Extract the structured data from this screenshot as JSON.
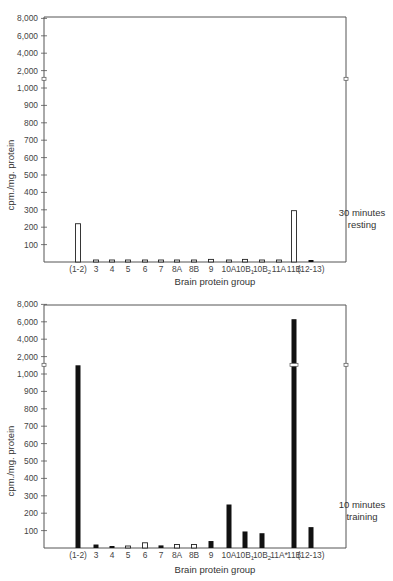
{
  "chart_data": [
    {
      "type": "bar",
      "title": "",
      "annotation": [
        "30 minutes",
        "resting"
      ],
      "xlabel": "Brain protein group",
      "ylabel": "cpm./mg. protein",
      "y_scale": "broken (linear 0–1,000 by 100, then 2,000–8,000 by 2,000)",
      "y_ticks": [
        "100",
        "200",
        "300",
        "400",
        "500",
        "600",
        "700",
        "800",
        "900",
        "1,000",
        "2,000",
        "4,000",
        "6,000",
        "8,000"
      ],
      "ylim": [
        0,
        8000
      ],
      "grid": false,
      "legend": "none",
      "categories": [
        "(1-2)",
        "3",
        "4",
        "5",
        "6",
        "7",
        "8A",
        "8B",
        "9",
        "10A",
        "10B1",
        "10B2",
        "11A",
        "11B",
        "(12-13)"
      ],
      "category_labels": [
        {
          "main": "(1-2)",
          "sub": ""
        },
        {
          "main": "3",
          "sub": ""
        },
        {
          "main": "4",
          "sub": ""
        },
        {
          "main": "5",
          "sub": ""
        },
        {
          "main": "6",
          "sub": ""
        },
        {
          "main": "7",
          "sub": ""
        },
        {
          "main": "8A",
          "sub": ""
        },
        {
          "main": "8B",
          "sub": ""
        },
        {
          "main": "9",
          "sub": ""
        },
        {
          "main": "10A",
          "sub": ""
        },
        {
          "main": "10B",
          "sub": "1"
        },
        {
          "main": "10B",
          "sub": "2"
        },
        {
          "main": "11A",
          "sub": ""
        },
        {
          "main": "11B",
          "sub": ""
        },
        {
          "main": "(12-13)",
          "sub": ""
        }
      ],
      "values": [
        220,
        5,
        5,
        5,
        5,
        5,
        5,
        5,
        15,
        5,
        15,
        5,
        5,
        295,
        5
      ],
      "fill": [
        "hollow",
        "hollow",
        "hollow",
        "hollow",
        "hollow",
        "hollow",
        "hollow",
        "hollow",
        "hollow",
        "hollow",
        "hollow",
        "hollow",
        "hollow",
        "hollow",
        "filled"
      ]
    },
    {
      "type": "bar",
      "title": "",
      "annotation": [
        "10 minutes",
        "training"
      ],
      "xlabel": "Brain protein group",
      "ylabel": "cpm./mg. protein",
      "y_scale": "broken (linear 0–1,000 by 100, then 2,000–8,000 by 2,000)",
      "y_ticks": [
        "100",
        "200",
        "300",
        "400",
        "500",
        "600",
        "700",
        "800",
        "900",
        "1,000",
        "2,000",
        "4,000",
        "6,000",
        "8,000"
      ],
      "ylim": [
        0,
        8000
      ],
      "grid": false,
      "legend": "none",
      "categories": [
        "(1-2)",
        "3",
        "4",
        "5",
        "6",
        "7",
        "8A",
        "8B",
        "9",
        "10A",
        "10B1",
        "10B2",
        "11A*",
        "11B",
        "(12-13)"
      ],
      "category_labels": [
        {
          "main": "(1-2)",
          "sub": ""
        },
        {
          "main": "3",
          "sub": ""
        },
        {
          "main": "4",
          "sub": ""
        },
        {
          "main": "5",
          "sub": ""
        },
        {
          "main": "6",
          "sub": ""
        },
        {
          "main": "7",
          "sub": ""
        },
        {
          "main": "8A",
          "sub": ""
        },
        {
          "main": "8B",
          "sub": ""
        },
        {
          "main": "9",
          "sub": ""
        },
        {
          "main": "10A",
          "sub": ""
        },
        {
          "main": "10B",
          "sub": "1"
        },
        {
          "main": "10B",
          "sub": "2"
        },
        {
          "main": "11A*",
          "sub": ""
        },
        {
          "main": "11B",
          "sub": ""
        },
        {
          "main": "(12-13)",
          "sub": ""
        }
      ],
      "values": [
        1500,
        20,
        5,
        10,
        30,
        15,
        20,
        20,
        40,
        250,
        95,
        85,
        0,
        6300,
        120
      ],
      "fill": [
        "filled",
        "filled",
        "filled",
        "hollow",
        "hollow",
        "filled",
        "hollow",
        "hollow",
        "filled",
        "filled",
        "filled",
        "filled",
        "filled",
        "filled",
        "filled"
      ]
    }
  ]
}
